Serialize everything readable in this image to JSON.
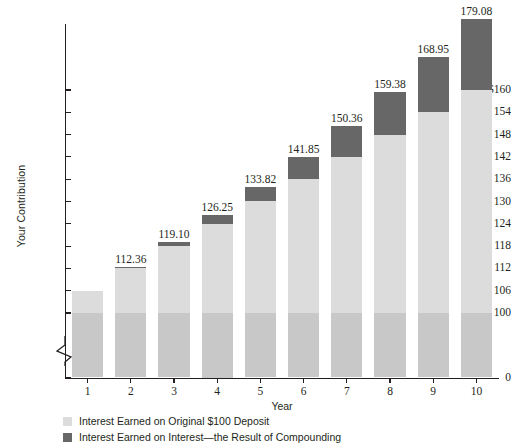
{
  "chart_data": {
    "type": "bar",
    "stacked": true,
    "title": "",
    "xlabel": "Year",
    "ylabel": "Your Contribution",
    "categories": [
      "1",
      "2",
      "3",
      "4",
      "5",
      "6",
      "7",
      "8",
      "9",
      "10"
    ],
    "values": [
      106.0,
      112.36,
      119.1,
      126.25,
      133.82,
      141.85,
      150.36,
      159.38,
      168.95,
      179.08
    ],
    "data_labels": [
      "",
      "112.36",
      "119.10",
      "126.25",
      "133.82",
      "141.85",
      "150.36",
      "159.38",
      "168.95",
      "179.08"
    ],
    "series": [
      {
        "name": "Original $100 Deposit",
        "color": "#c8c8c8",
        "values": [
          100,
          100,
          100,
          100,
          100,
          100,
          100,
          100,
          100,
          100
        ]
      },
      {
        "name": "Interest Earned on Original $100 Deposit",
        "color": "#dcdcdc",
        "values": [
          6.0,
          12.0,
          18.0,
          24.0,
          30.0,
          36.0,
          42.0,
          48.0,
          54.0,
          60.0
        ]
      },
      {
        "name": "Interest Earned on Interest—the Result of Compounding",
        "color": "#676767",
        "values": [
          0.0,
          0.36,
          1.1,
          2.25,
          3.82,
          5.85,
          8.36,
          11.38,
          14.95,
          19.08
        ]
      }
    ],
    "ylim": [
      0,
      166
    ],
    "yticks": [
      "0",
      "100",
      "106",
      "112",
      "118",
      "124",
      "130",
      "136",
      "142",
      "148",
      "154",
      "$160"
    ],
    "ytick_values": [
      0,
      100,
      106,
      112,
      118,
      124,
      130,
      136,
      142,
      148,
      154,
      160
    ],
    "axis_break": true,
    "grid": false,
    "legend_position": "bottom-left",
    "legend": [
      {
        "label": "Interest Earned on Original $100 Deposit",
        "color": "#dcdcdc"
      },
      {
        "label": "Interest Earned on Interest—the Result of Compounding",
        "color": "#676767"
      }
    ]
  },
  "colors": {
    "axis": "#231f20",
    "principal": "#c8c8c8",
    "simple_interest": "#dcdcdc",
    "compound_interest": "#676767",
    "background": "#ffffff"
  }
}
